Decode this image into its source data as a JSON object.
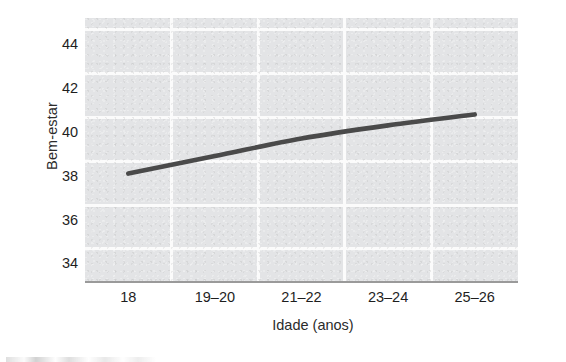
{
  "chart_data": {
    "type": "line",
    "title": "",
    "xlabel": "Idade (anos)",
    "ylabel": "Bem-estar",
    "categories": [
      "18",
      "19–20",
      "21–22",
      "23–24",
      "25–26"
    ],
    "series": [
      {
        "name": "Bem-estar",
        "values": [
          38.1,
          38.9,
          39.7,
          40.3,
          40.8
        ],
        "color": "#4a4a4a"
      }
    ],
    "ylim": [
      33.2,
      45.2
    ],
    "yticks": [
      "34",
      "36",
      "38",
      "40",
      "42",
      "44"
    ],
    "ytick_values": [
      34,
      36,
      38,
      40,
      42,
      44
    ],
    "grid": true,
    "grid_color": "#fbfbfb",
    "panel_color": "#e3e4e6",
    "axis_color": "#9a9a9a",
    "legend": "none"
  }
}
